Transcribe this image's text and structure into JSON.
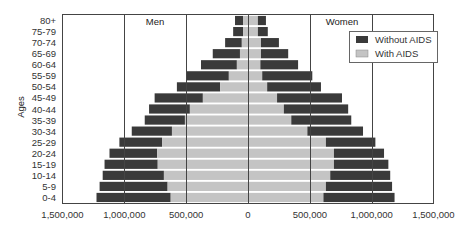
{
  "chart_data": {
    "type": "bar",
    "subtype": "population-pyramid",
    "title": "",
    "xlabel": "",
    "ylabel": "Ages",
    "panel_labels": {
      "left": "Men",
      "right": "Women"
    },
    "xlim": [
      -1500000,
      1500000
    ],
    "x_ticks": [
      "1,500,000",
      "1,000,000",
      "500,000",
      "0",
      "500,000",
      "1,000,000",
      "1,500,000"
    ],
    "x_tick_values": [
      -1500000,
      -1000000,
      -500000,
      0,
      500000,
      1000000,
      1500000
    ],
    "grid": "vertical lines at 500,000 intervals",
    "legend": {
      "position": "upper right",
      "entries": [
        "Without AIDS",
        "With AIDS"
      ]
    },
    "colors": {
      "without_aids": "#3a3a3a",
      "with_aids": "#c4c4c4",
      "frame": "#444444"
    },
    "categories": [
      "80+",
      "75-79",
      "70-74",
      "65-69",
      "60-64",
      "55-59",
      "50-54",
      "45-49",
      "40-44",
      "35-39",
      "30-34",
      "25-29",
      "20-24",
      "15-19",
      "10-14",
      "5-9",
      "0-4"
    ],
    "series": [
      {
        "name": "Men - Without AIDS",
        "values": [
          105000,
          120000,
          185000,
          285000,
          380000,
          500000,
          575000,
          755000,
          800000,
          835000,
          940000,
          1040000,
          1120000,
          1160000,
          1175000,
          1200000,
          1225000
        ]
      },
      {
        "name": "Men - With AIDS",
        "values": [
          40000,
          40000,
          50000,
          65000,
          90000,
          155000,
          225000,
          365000,
          470000,
          510000,
          615000,
          695000,
          735000,
          730000,
          680000,
          650000,
          625000
        ]
      },
      {
        "name": "Women - Without AIDS",
        "values": [
          145000,
          160000,
          250000,
          325000,
          405000,
          520000,
          590000,
          760000,
          810000,
          835000,
          930000,
          1030000,
          1100000,
          1135000,
          1150000,
          1165000,
          1185000
        ]
      },
      {
        "name": "Women - With AIDS",
        "values": [
          80000,
          80000,
          105000,
          105000,
          100000,
          115000,
          155000,
          235000,
          290000,
          350000,
          480000,
          630000,
          695000,
          695000,
          665000,
          630000,
          610000
        ]
      }
    ]
  }
}
